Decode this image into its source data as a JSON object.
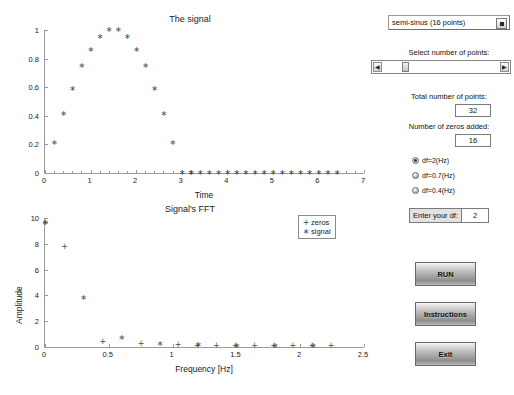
{
  "signal_plot": {
    "title": "The signal",
    "xlabel": "Time",
    "ylabel": ""
  },
  "fft_plot": {
    "title": "Signal's FFT",
    "xlabel": "Frequency [Hz]",
    "ylabel": "Amplitude",
    "legend": [
      {
        "label": "zeros",
        "marker": "+"
      },
      {
        "label": "signal",
        "marker": "*"
      }
    ]
  },
  "controls": {
    "signal_select": {
      "value": "semi-sinus (16 points)",
      "options": [
        "semi-sinus (16 points)"
      ]
    },
    "slider_label": "Select  number of points:",
    "slider_position_pct": 18,
    "total_points_label": "Total number of points:",
    "total_points_value": "32",
    "zeros_added_label": "Number of zeros added:",
    "zeros_added_value": "16",
    "radios": [
      {
        "label": "df=2(Hz)",
        "selected": true
      },
      {
        "label": "df=0.7(Hz)",
        "selected": false
      },
      {
        "label": "df=0.4(Hz)",
        "selected": false
      }
    ],
    "df_field_label": "Enter your df:",
    "df_field_value": "2",
    "buttons": [
      {
        "label": "RUN"
      },
      {
        "label": "Instructions"
      },
      {
        "label": "Exit"
      }
    ]
  },
  "chart_data": [
    {
      "type": "scatter",
      "title": "The signal",
      "xlabel": "Time",
      "ylabel": "",
      "xlim": [
        0,
        7
      ],
      "ylim": [
        0,
        1
      ],
      "xticks": [
        0,
        1,
        2,
        3,
        4,
        5,
        6,
        7
      ],
      "yticks": [
        0,
        0.2,
        0.4,
        0.6,
        0.8,
        1
      ],
      "grid": false,
      "series": [
        {
          "name": "signal",
          "marker": "*",
          "x": [
            0.2,
            0.4,
            0.6,
            0.8,
            1.0,
            1.2,
            1.4,
            1.6,
            1.8,
            2.0,
            2.2,
            2.4,
            2.6,
            2.8,
            3.0,
            3.2
          ],
          "y": [
            0.21,
            0.41,
            0.59,
            0.75,
            0.86,
            0.95,
            1.0,
            1.0,
            0.95,
            0.86,
            0.75,
            0.59,
            0.41,
            0.21,
            0.0,
            0.0
          ]
        },
        {
          "name": "zeros",
          "marker": "*",
          "x": [
            3.2,
            3.4,
            3.6,
            3.8,
            4.0,
            4.2,
            4.4,
            4.6,
            4.8,
            5.0,
            5.2,
            5.4,
            5.6,
            5.8,
            6.0,
            6.2,
            6.4
          ],
          "y": [
            0,
            0,
            0,
            0,
            0,
            0,
            0,
            0,
            0,
            0,
            0,
            0,
            0,
            0,
            0,
            0,
            0
          ]
        }
      ]
    },
    {
      "type": "scatter",
      "title": "Signal's FFT",
      "xlabel": "Frequency [Hz]",
      "ylabel": "Amplitude",
      "xlim": [
        0,
        2.5
      ],
      "ylim": [
        0,
        10
      ],
      "xticks": [
        0,
        0.5,
        1,
        1.5,
        2,
        2.5
      ],
      "yticks": [
        0,
        2,
        4,
        6,
        8,
        10
      ],
      "grid": false,
      "series": [
        {
          "name": "zeros",
          "marker": "+",
          "x": [
            0.0,
            0.15,
            0.45,
            0.75,
            1.04,
            1.19,
            1.34,
            1.49,
            1.64,
            1.79,
            1.94,
            2.09,
            2.24
          ],
          "y": [
            9.6,
            7.75,
            0.42,
            0.2,
            0.14,
            0.1,
            0.08,
            0.1,
            0.06,
            0.06,
            0.06,
            0.05,
            0.08
          ]
        },
        {
          "name": "signal",
          "marker": "*",
          "x": [
            0.0,
            0.3,
            0.6,
            0.9,
            1.2,
            1.5,
            1.8,
            2.1
          ],
          "y": [
            9.6,
            3.8,
            0.66,
            0.27,
            0.12,
            0.1,
            0.07,
            0.05
          ]
        }
      ]
    }
  ]
}
